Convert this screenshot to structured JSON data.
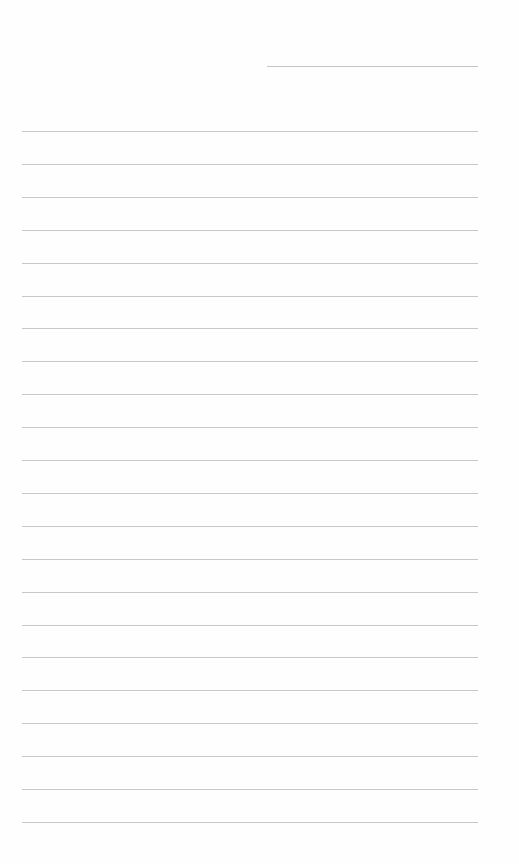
{
  "page": {
    "type": "lined-paper",
    "background_color": "#fefefe",
    "line_color": "#c8c8c8",
    "header_line": {
      "left": 267,
      "top": 66,
      "width": 211
    },
    "rules": {
      "count": 22,
      "first_top": 131,
      "spacing": 32.9,
      "left": 22,
      "width": 456
    }
  }
}
